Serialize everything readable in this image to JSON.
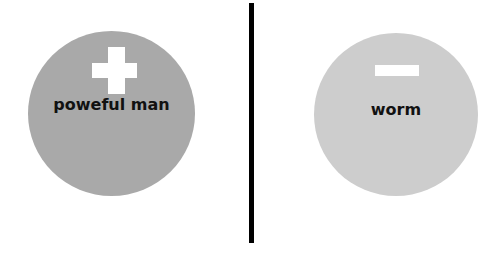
{
  "left": {
    "label": "poweful man",
    "symbol": "plus-icon",
    "circle_color": "#a9a9a9"
  },
  "right": {
    "label": "worm",
    "symbol": "minus-icon",
    "circle_color": "#cdcdcd"
  },
  "divider_color": "#000000"
}
